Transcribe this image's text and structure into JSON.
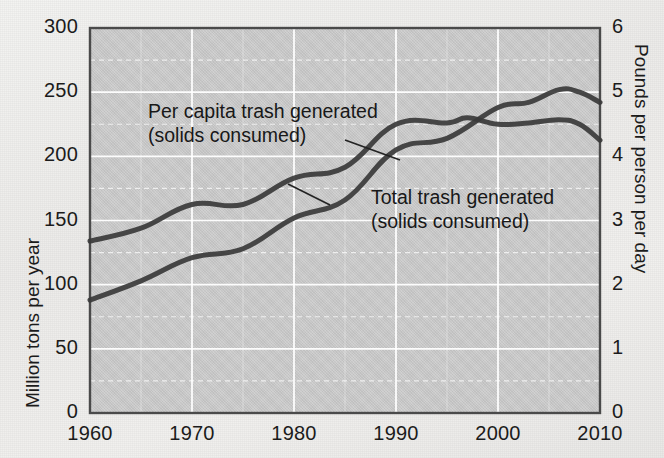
{
  "chart_data": {
    "type": "line",
    "title": "",
    "xlabel": "",
    "ylabel": "Million tons per year",
    "y2label": "Pounds per person per day",
    "xlim": [
      1960,
      2010
    ],
    "ylim": [
      0,
      300
    ],
    "y2lim": [
      0,
      6
    ],
    "xticks": [
      "1960",
      "1970",
      "1980",
      "1990",
      "2000",
      "2010"
    ],
    "xtick_values": [
      1960,
      1970,
      1980,
      1990,
      2000,
      2010
    ],
    "yticks": [
      "0",
      "50",
      "100",
      "150",
      "200",
      "250",
      "300"
    ],
    "ytick_values": [
      0,
      50,
      100,
      150,
      200,
      250,
      300
    ],
    "y2ticks": [
      "0",
      "1",
      "2",
      "3",
      "4",
      "5",
      "6"
    ],
    "y2tick_values": [
      0,
      1,
      2,
      3,
      4,
      5,
      6
    ],
    "grid": true,
    "grid_color": "#ffffff",
    "plot_background": "#c9c9c9",
    "line_color": "#3a3a3a",
    "legend": "inline-annotations",
    "series": [
      {
        "name": "Total trash generated (solids consumed)",
        "axis": "left",
        "unit": "million tons per year",
        "x": [
          1960,
          1965,
          1970,
          1975,
          1980,
          1985,
          1990,
          1995,
          2000,
          2003,
          2006,
          2008,
          2010
        ],
        "values": [
          88,
          103,
          121,
          128,
          152,
          166,
          205,
          214,
          238,
          242,
          252,
          250,
          242
        ]
      },
      {
        "name": "Per capita trash generated (solids consumed)",
        "axis": "right",
        "unit": "pounds per person per day",
        "x": [
          1960,
          1965,
          1970,
          1975,
          1980,
          1985,
          1990,
          1995,
          1997,
          2000,
          2003,
          2006,
          2008,
          2010
        ],
        "values": [
          2.68,
          2.88,
          3.25,
          3.25,
          3.66,
          3.83,
          4.5,
          4.52,
          4.6,
          4.5,
          4.52,
          4.57,
          4.5,
          4.25
        ]
      }
    ],
    "annotations": [
      {
        "name": "per-capita-annotation",
        "line1": "Per capita trash generated",
        "line2": "(solids consumed)",
        "leader_from": [
          345,
          140
        ],
        "leader_to": [
          400,
          160
        ]
      },
      {
        "name": "total-annotation",
        "line1": "Total trash generated",
        "line2": "(solids consumed)",
        "leader_from": [
          330,
          205
        ],
        "leader_to": [
          288,
          184
        ]
      }
    ]
  },
  "axes": {
    "left": {
      "title": "Million tons per year"
    },
    "right": {
      "title": "Pounds per person per day"
    }
  },
  "annotations": {
    "per_capita": {
      "line1": "Per capita trash generated",
      "line2": "(solids consumed)"
    },
    "total": {
      "line1": "Total trash generated",
      "line2": "(solids consumed)"
    }
  }
}
